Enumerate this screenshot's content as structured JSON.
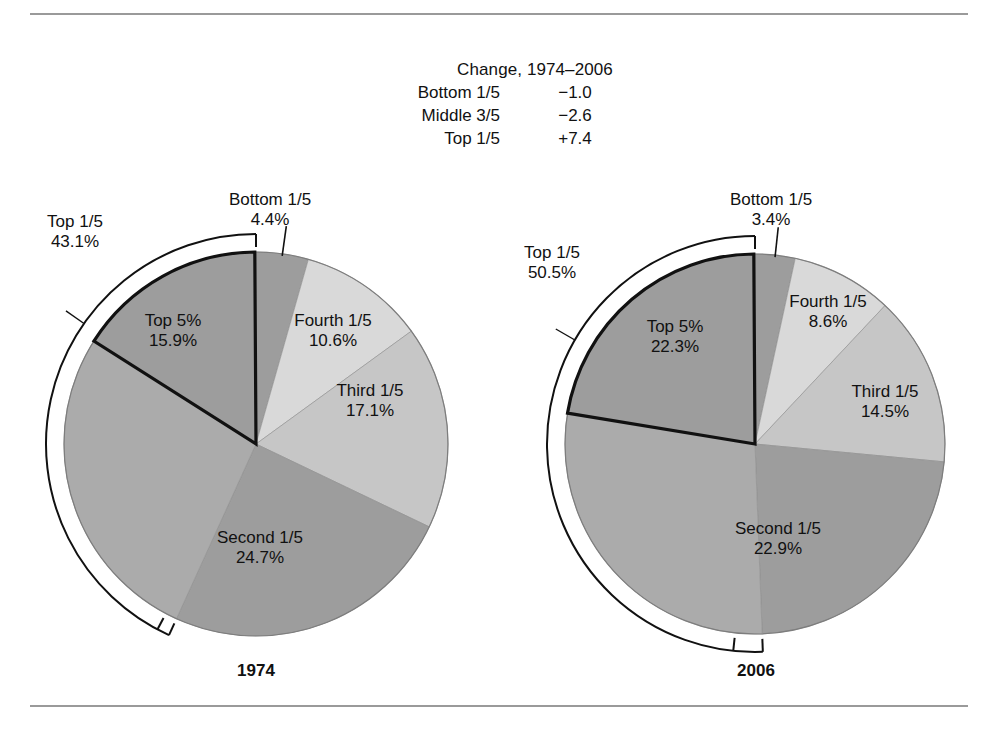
{
  "figure": {
    "rules": [
      "top-rule",
      "bottom-rule"
    ]
  },
  "change_table": {
    "title": "Change, 1974–2006",
    "rows": [
      {
        "label": "Bottom 1/5",
        "value": "−1.0"
      },
      {
        "label": "Middle 3/5",
        "value": "−2.6"
      },
      {
        "label": "Top 1/5",
        "value": "+7.4"
      }
    ]
  },
  "charts": [
    {
      "year": "1974",
      "bracket_label": "Top 1/5",
      "bracket_value": "43.1%",
      "callout_label": "Bottom 1/5",
      "callout_value": "4.4%",
      "slices": [
        {
          "name": "Bottom 1/5",
          "label": "Bottom 1/5",
          "value_label": "4.4%",
          "value": 4.4,
          "color": "#9d9d9d"
        },
        {
          "name": "Fourth 1/5",
          "label": "Fourth 1/5",
          "value_label": "10.6%",
          "value": 10.6,
          "color": "#d9d9d9"
        },
        {
          "name": "Third 1/5",
          "label": "Third 1/5",
          "value_label": "17.1%",
          "value": 17.1,
          "color": "#c6c6c6"
        },
        {
          "name": "Second 1/5",
          "label": "Second 1/5",
          "value_label": "24.7%",
          "value": 24.7,
          "color": "#9d9d9d"
        },
        {
          "name": "Top 1/5 remainder",
          "label": "",
          "value_label": "",
          "value": 27.2,
          "color": "#ababab"
        },
        {
          "name": "Top 5%",
          "label": "Top 5%",
          "value_label": "15.9%",
          "value": 15.9,
          "color": "#9d9d9d"
        }
      ]
    },
    {
      "year": "2006",
      "bracket_label": "Top 1/5",
      "bracket_value": "50.5%",
      "callout_label": "Bottom 1/5",
      "callout_value": "3.4%",
      "slices": [
        {
          "name": "Bottom 1/5",
          "label": "Bottom 1/5",
          "value_label": "3.4%",
          "value": 3.4,
          "color": "#9d9d9d"
        },
        {
          "name": "Fourth 1/5",
          "label": "Fourth 1/5",
          "value_label": "8.6%",
          "value": 8.6,
          "color": "#d9d9d9"
        },
        {
          "name": "Third 1/5",
          "label": "Third 1/5",
          "value_label": "14.5%",
          "value": 14.5,
          "color": "#c6c6c6"
        },
        {
          "name": "Second 1/5",
          "label": "Second 1/5",
          "value_label": "22.9%",
          "value": 22.9,
          "color": "#9d9d9d"
        },
        {
          "name": "Top 1/5 remainder",
          "label": "",
          "value_label": "",
          "value": 28.2,
          "color": "#ababab"
        },
        {
          "name": "Top 5%",
          "label": "Top 5%",
          "value_label": "22.3%",
          "value": 22.3,
          "color": "#9d9d9d"
        }
      ]
    }
  ],
  "chart_data": {
    "type": "pie",
    "note": "Two pie charts; percentages are share of total income. Top 5% is a sub-slice of Top 1/5, outlined in heavy black. A bracket outside each pie spans the Top 1/5 share.",
    "charts": [
      {
        "title": "1974",
        "categories": [
          "Bottom 1/5",
          "Fourth 1/5",
          "Third 1/5",
          "Second 1/5",
          "Top 1/5"
        ],
        "values": [
          4.4,
          10.6,
          17.1,
          24.7,
          43.1
        ],
        "sub_slice": {
          "name": "Top 5%",
          "value": 15.9,
          "parent": "Top 1/5"
        },
        "start_angle_deg": 0,
        "direction": "clockwise",
        "labels_shown": [
          "Bottom 1/5 4.4%",
          "Fourth 1/5 10.6%",
          "Third 1/5 17.1%",
          "Second 1/5 24.7%",
          "Top 1/5 43.1%",
          "Top 5% 15.9%"
        ]
      },
      {
        "title": "2006",
        "categories": [
          "Bottom 1/5",
          "Fourth 1/5",
          "Third 1/5",
          "Second 1/5",
          "Top 1/5"
        ],
        "values": [
          3.4,
          8.6,
          14.5,
          22.9,
          50.5
        ],
        "sub_slice": {
          "name": "Top 5%",
          "value": 22.3,
          "parent": "Top 1/5"
        },
        "start_angle_deg": 0,
        "direction": "clockwise",
        "labels_shown": [
          "Bottom 1/5 3.4%",
          "Fourth 1/5 8.6%",
          "Third 1/5 14.5%",
          "Second 1/5 22.9%",
          "Top 1/5 50.5%",
          "Top 5% 22.3%"
        ]
      }
    ],
    "change_table": {
      "header": "Change, 1974–2006",
      "categories": [
        "Bottom 1/5",
        "Middle 3/5",
        "Top 1/5"
      ],
      "values": [
        -1.0,
        -2.6,
        7.4
      ],
      "value_labels": [
        "−1.0",
        "−2.6",
        "+7.4"
      ]
    },
    "legend": "none",
    "grid": false
  }
}
